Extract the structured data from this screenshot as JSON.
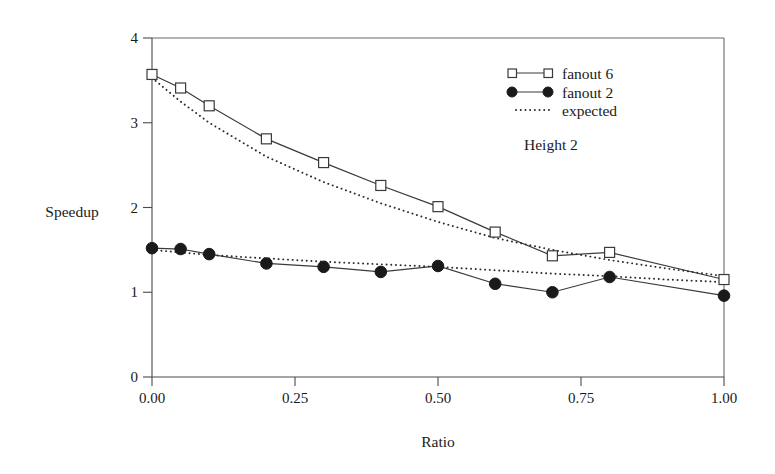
{
  "chart_data": {
    "type": "line",
    "title": "",
    "xlabel": "Ratio",
    "ylabel": "Speedup",
    "xlim": [
      0.0,
      1.0
    ],
    "ylim": [
      0,
      4
    ],
    "xticks": [
      0.0,
      0.25,
      0.5,
      0.75,
      1.0
    ],
    "xticklabels": [
      "0.00",
      "0.25",
      "0.50",
      "0.75",
      "1.00"
    ],
    "yticks": [
      0,
      1,
      2,
      3,
      4
    ],
    "yticklabels": [
      "0",
      "1",
      "2",
      "3",
      "4"
    ],
    "grid": false,
    "legend_position": "top-right",
    "annotations": [
      {
        "text": "Height 2",
        "x": 0.66,
        "y": 3.32
      }
    ],
    "series": [
      {
        "name": "fanout 6",
        "marker": "open-square",
        "linestyle": "solid",
        "x": [
          0.0,
          0.05,
          0.1,
          0.2,
          0.3,
          0.4,
          0.5,
          0.6,
          0.7,
          0.8,
          1.0
        ],
        "y": [
          3.57,
          3.41,
          3.2,
          2.81,
          2.53,
          2.26,
          2.01,
          1.71,
          1.43,
          1.47,
          1.15
        ]
      },
      {
        "name": "fanout 2",
        "marker": "filled-circle",
        "linestyle": "solid",
        "x": [
          0.0,
          0.05,
          0.1,
          0.2,
          0.3,
          0.4,
          0.5,
          0.6,
          0.7,
          0.8,
          1.0
        ],
        "y": [
          1.52,
          1.51,
          1.45,
          1.34,
          1.3,
          1.24,
          1.31,
          1.1,
          1.0,
          1.18,
          0.96
        ]
      },
      {
        "name": "expected (fanout 6)",
        "marker": "none",
        "linestyle": "dotted",
        "x": [
          0.0,
          0.05,
          0.1,
          0.2,
          0.3,
          0.4,
          0.5,
          0.6,
          0.7,
          0.8,
          0.9,
          1.0
        ],
        "y": [
          3.53,
          3.25,
          3.0,
          2.6,
          2.3,
          2.05,
          1.83,
          1.64,
          1.5,
          1.38,
          1.28,
          1.19
        ]
      },
      {
        "name": "expected (fanout 2)",
        "marker": "none",
        "linestyle": "dotted",
        "x": [
          0.0,
          0.05,
          0.1,
          0.2,
          0.3,
          0.4,
          0.5,
          0.6,
          0.7,
          0.8,
          0.9,
          1.0
        ],
        "y": [
          1.5,
          1.47,
          1.44,
          1.4,
          1.36,
          1.33,
          1.3,
          1.26,
          1.22,
          1.19,
          1.15,
          1.12
        ]
      }
    ],
    "legend_entries": [
      {
        "label": "fanout 6",
        "marker": "open-square",
        "linestyle": "solid"
      },
      {
        "label": "fanout 2",
        "marker": "filled-circle",
        "linestyle": "solid"
      },
      {
        "label": "expected",
        "marker": "none",
        "linestyle": "dotted"
      }
    ]
  },
  "colors": {
    "background": "#ffffff",
    "line": "#3a3a3a",
    "axis": "#4a4a4a",
    "marker_fill": "#1a1a1a",
    "text": "#1a1a1a"
  }
}
